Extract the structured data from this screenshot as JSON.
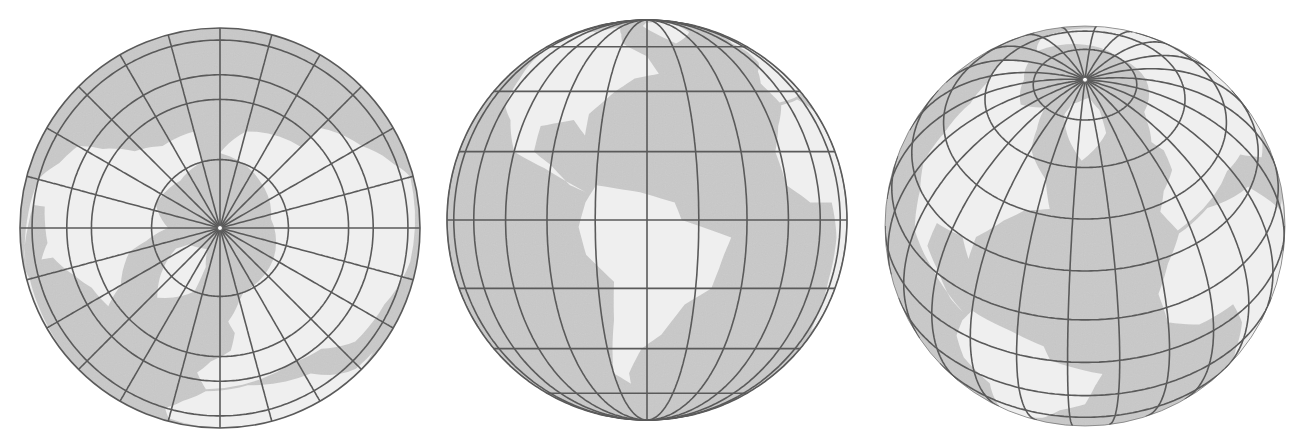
{
  "figure": {
    "colors": {
      "background": "#ffffff",
      "ocean": "#c9c9c9",
      "land": "#efefef",
      "graticule": "#5a5a5a"
    },
    "globes": [
      {
        "name": "polar-aspect",
        "cx": 220,
        "cy": 228,
        "r": 200,
        "center_lat": 90,
        "center_lon": 0,
        "meridian_step": 15,
        "parallels": [
          20,
          40,
          50,
          70
        ],
        "clip": false
      },
      {
        "name": "equatorial-aspect",
        "cx": 647,
        "cy": 220,
        "r": 200,
        "center_lat": 0,
        "center_lon": -60,
        "meridian_step": 15,
        "parallels": [
          -60,
          -40,
          -20,
          0,
          20,
          40,
          60
        ],
        "clip": false
      },
      {
        "name": "oblique-aspect",
        "cx": 1085,
        "cy": 226,
        "r": 200,
        "center_lat": 43,
        "center_lon": -40,
        "meridian_step": 15,
        "parallels": [
          -30,
          -15,
          0,
          15,
          30,
          45,
          60,
          75
        ],
        "clip": true
      }
    ]
  }
}
